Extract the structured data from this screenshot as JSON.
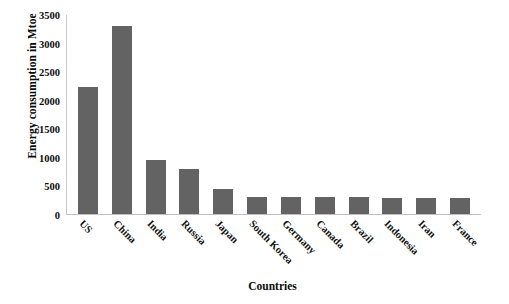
{
  "chart_data": {
    "type": "bar",
    "title": "",
    "xlabel": "Countries",
    "ylabel": "Energy consumption in Mtoe",
    "categories": [
      "US",
      "China",
      "India",
      "Russia",
      "Japan",
      "South Korea",
      "Germany",
      "Canada",
      "Brazil",
      "Indonesia",
      "Iran",
      "France"
    ],
    "values": [
      2220,
      3285,
      940,
      795,
      435,
      305,
      300,
      300,
      295,
      285,
      280,
      280
    ],
    "ylim": [
      0,
      3500
    ],
    "ytick_step": 500,
    "ytick_labels": [
      "3500",
      "3000",
      "2500",
      "2000",
      "1500",
      "1000",
      "500",
      "0"
    ],
    "ytick_values": [
      3500,
      3000,
      2500,
      2000,
      1500,
      1000,
      500,
      0
    ],
    "grid": false,
    "legend": false,
    "legend_position": "none",
    "bar_color": "#636363",
    "axis_color": "#c4c4c4",
    "text_color": "#0d0d0d",
    "background": "#ffffff",
    "series": [
      {
        "name": "Energy consumption",
        "values": [
          2220,
          3285,
          940,
          795,
          435,
          305,
          300,
          300,
          295,
          285,
          280,
          280
        ]
      }
    ]
  }
}
